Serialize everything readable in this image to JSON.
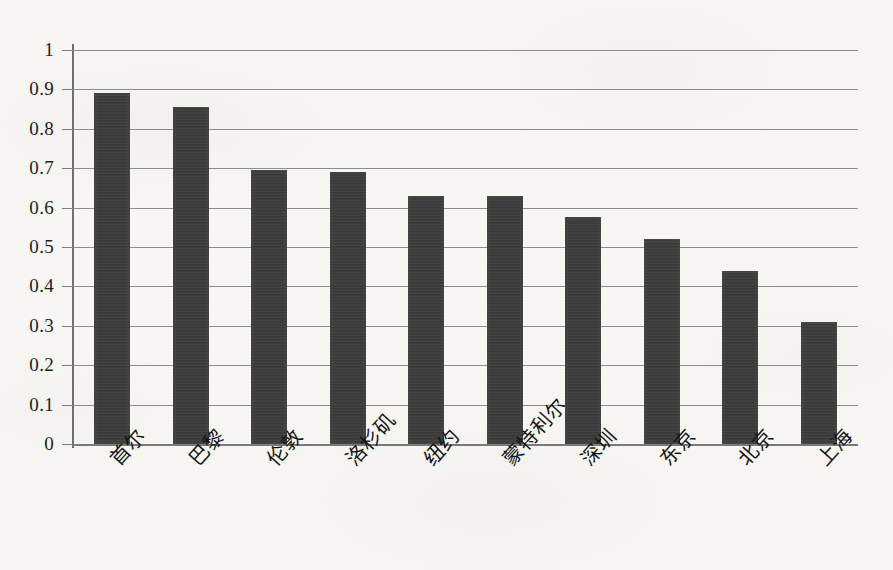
{
  "chart_data": {
    "type": "bar",
    "title": "",
    "xlabel": "",
    "ylabel": "",
    "categories": [
      "首尔",
      "巴黎",
      "伦敦",
      "洛杉矶",
      "纽约",
      "蒙特利尔",
      "深圳",
      "东京",
      "北京",
      "上海"
    ],
    "values": [
      0.89,
      0.855,
      0.695,
      0.69,
      0.63,
      0.63,
      0.575,
      0.52,
      0.44,
      0.31
    ],
    "ylim": [
      0,
      1
    ],
    "ytick_labels": [
      "1",
      "0.9",
      "0.8",
      "0.7",
      "0.6",
      "0.5",
      "0.4",
      "0.3",
      "0.2",
      "0.1",
      "0"
    ],
    "ytick_values": [
      1,
      0.9,
      0.8,
      0.7,
      0.6,
      0.5,
      0.4,
      0.3,
      0.2,
      0.1,
      0
    ],
    "grid": true,
    "legend": null,
    "legend_position": "none",
    "series": [
      {
        "name": "",
        "values": [
          0.89,
          0.855,
          0.695,
          0.69,
          0.63,
          0.63,
          0.575,
          0.52,
          0.44,
          0.31
        ]
      }
    ],
    "colors": {
      "bar": "#3b3b3b",
      "gridline": "#8d8d8d",
      "axis": "#6f6f6f",
      "text": "#1d1d1d",
      "background": "#f7f6f3"
    }
  }
}
